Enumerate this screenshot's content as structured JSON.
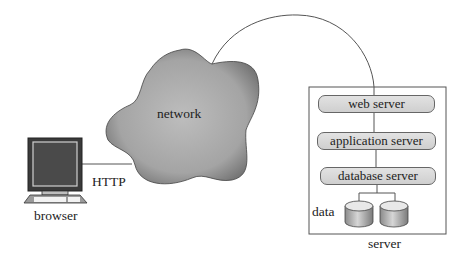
{
  "diagram": {
    "client": {
      "label": "browser",
      "protocol_label": "HTTP"
    },
    "network": {
      "label": "network"
    },
    "server": {
      "label": "server",
      "tiers": [
        {
          "label": "web server"
        },
        {
          "label": "application server"
        },
        {
          "label": "database server"
        }
      ],
      "storage": {
        "label": "data",
        "disk_count": 2
      }
    },
    "connections": [
      {
        "from": "browser",
        "to": "network",
        "label": "HTTP"
      },
      {
        "from": "network",
        "to": "web server"
      },
      {
        "from": "web server",
        "to": "application server"
      },
      {
        "from": "application server",
        "to": "database server"
      },
      {
        "from": "database server",
        "to": "data"
      }
    ]
  }
}
